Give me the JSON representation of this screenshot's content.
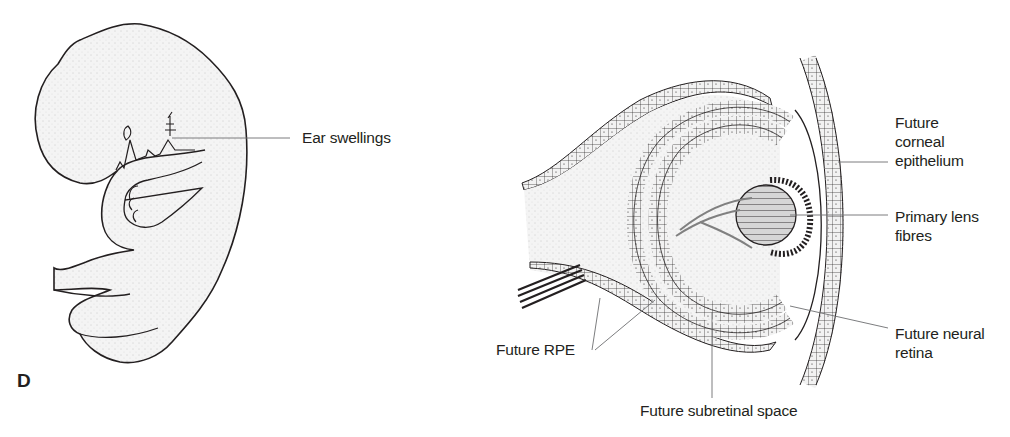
{
  "figure": {
    "panel_letter": "D",
    "left_panel": {
      "subject": "embryo-lateral-view",
      "labels": [
        {
          "id": "ear-swellings",
          "text": "Ear swellings"
        }
      ]
    },
    "right_panel": {
      "subject": "optic-cup-section",
      "labels": [
        {
          "id": "future-corneal-epithelium",
          "text": "Future\ncorneal\nepithelium"
        },
        {
          "id": "primary-lens-fibres",
          "text": "Primary lens\nfibres"
        },
        {
          "id": "future-neural-retina",
          "text": "Future neural\nretina"
        },
        {
          "id": "future-rpe",
          "text": "Future RPE"
        },
        {
          "id": "future-subretinal-space",
          "text": "Future subretinal space"
        }
      ]
    },
    "colors": {
      "line": "#231f20",
      "leader": "#6d6e71",
      "fill": "#f1f1f1",
      "lens_fill": "#d9d9d9"
    }
  }
}
